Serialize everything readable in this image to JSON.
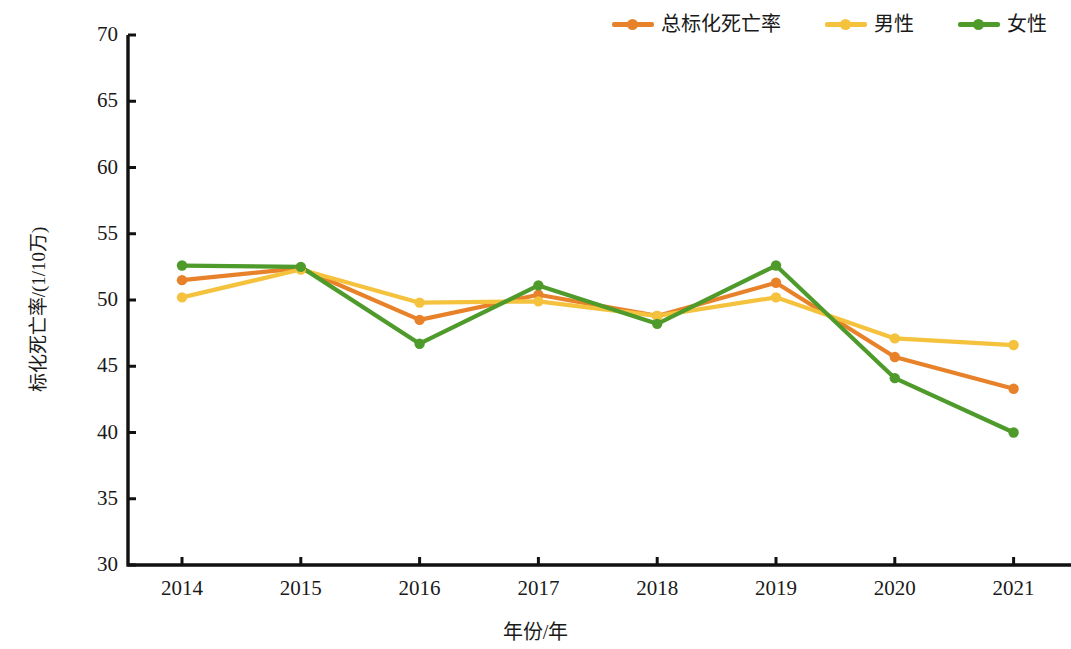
{
  "chart_data": {
    "type": "line",
    "title": "",
    "xlabel": "年份/年",
    "ylabel": "标化死亡率/(1/10万)",
    "x": [
      2014,
      2015,
      2016,
      2017,
      2018,
      2019,
      2020,
      2021
    ],
    "categories": [
      "2014",
      "2015",
      "2016",
      "2017",
      "2018",
      "2019",
      "2020",
      "2021"
    ],
    "xticks": [
      "2014",
      "2015",
      "2016",
      "2017",
      "2018",
      "2019",
      "2020",
      "2021"
    ],
    "yticks": [
      "30",
      "35",
      "40",
      "45",
      "50",
      "55",
      "60",
      "65",
      "70"
    ],
    "ylim": [
      30,
      70
    ],
    "ytick_step": 5,
    "grid": false,
    "legend_position": "top-right",
    "series": [
      {
        "name": "总标化死亡率",
        "color": "#E8822A",
        "values": [
          51.5,
          52.4,
          48.5,
          50.4,
          48.8,
          51.3,
          45.7,
          43.3
        ]
      },
      {
        "name": "男性",
        "color": "#F5C23E",
        "values": [
          50.2,
          52.3,
          49.8,
          49.9,
          48.8,
          50.2,
          47.1,
          46.6
        ]
      },
      {
        "name": "女性",
        "color": "#4E9B2B",
        "values": [
          52.6,
          52.5,
          46.7,
          51.1,
          48.2,
          52.6,
          44.1,
          40.0
        ]
      }
    ]
  },
  "legend": {
    "items": [
      {
        "label": "总标化死亡率",
        "color": "#E8822A",
        "icon": "line-marker-icon"
      },
      {
        "label": "男性",
        "color": "#F5C23E",
        "icon": "line-marker-icon"
      },
      {
        "label": "女性",
        "color": "#4E9B2B",
        "icon": "line-marker-icon"
      }
    ]
  },
  "axes": {
    "y_title": "标化死亡率/(1/10万)",
    "x_title": "年份/年",
    "y_tick_labels": [
      "70",
      "65",
      "60",
      "55",
      "50",
      "45",
      "40",
      "35",
      "30"
    ],
    "x_tick_labels": [
      "2014",
      "2015",
      "2016",
      "2017",
      "2018",
      "2019",
      "2020",
      "2021"
    ]
  }
}
